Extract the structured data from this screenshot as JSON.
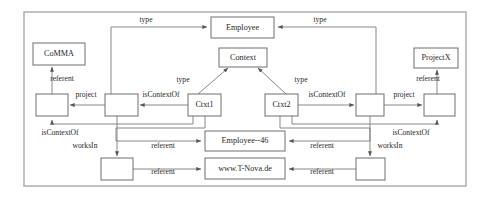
{
  "diagram": {
    "frame": {
      "x": 24,
      "y": 12,
      "width": 442,
      "height": 174,
      "stroke": "#a8a8a8"
    },
    "colors": {
      "background": "#ffffff",
      "node_stroke": "#6e6e6e",
      "edge_stroke": "#7a7a7a",
      "text": "#1f1f1f",
      "frame_stroke": "#a8a8a8"
    },
    "nodes": [
      {
        "id": "comma",
        "label": "CoMMA",
        "x": 33,
        "y": 43,
        "w": 52,
        "h": 22,
        "empty": false
      },
      {
        "id": "employee",
        "label": "Employee",
        "x": 211,
        "y": 17,
        "w": 63,
        "h": 21,
        "empty": false
      },
      {
        "id": "context",
        "label": "Context",
        "x": 219,
        "y": 48,
        "w": 48,
        "h": 19,
        "empty": false
      },
      {
        "id": "projectx",
        "label": "ProjectX",
        "x": 414,
        "y": 48,
        "w": 44,
        "h": 20,
        "empty": false
      },
      {
        "id": "ctxt1",
        "label": "Ctxt1",
        "x": 188,
        "y": 94,
        "w": 33,
        "h": 22,
        "empty": false
      },
      {
        "id": "ctxt2",
        "label": "Ctxt2",
        "x": 265,
        "y": 94,
        "w": 33,
        "h": 22,
        "empty": false
      },
      {
        "id": "employee46",
        "label": "Employee--46",
        "x": 205,
        "y": 131,
        "w": 80,
        "h": 20,
        "empty": false
      },
      {
        "id": "tnova",
        "label": "www.T-Nova.de",
        "x": 205,
        "y": 158,
        "w": 80,
        "h": 21,
        "empty": false
      },
      {
        "id": "blank-l1",
        "label": "",
        "x": 36,
        "y": 94,
        "w": 32,
        "h": 22,
        "empty": true
      },
      {
        "id": "blank-l2",
        "label": "",
        "x": 105,
        "y": 94,
        "w": 33,
        "h": 22,
        "empty": true
      },
      {
        "id": "blank-r1",
        "label": "",
        "x": 356,
        "y": 94,
        "w": 28,
        "h": 22,
        "empty": true
      },
      {
        "id": "blank-r2",
        "label": "",
        "x": 424,
        "y": 94,
        "w": 31,
        "h": 22,
        "empty": true
      },
      {
        "id": "blank-bl",
        "label": "",
        "x": 101,
        "y": 158,
        "w": 32,
        "h": 22,
        "empty": true
      },
      {
        "id": "blank-br",
        "label": "",
        "x": 356,
        "y": 158,
        "w": 29,
        "h": 22,
        "empty": true
      }
    ],
    "edge_labels": [
      {
        "id": "type-top-left",
        "text": "type",
        "x": 146,
        "y": 20
      },
      {
        "id": "type-top-right",
        "text": "type",
        "x": 320,
        "y": 20
      },
      {
        "id": "type-ctxt1",
        "text": "type",
        "x": 183,
        "y": 80
      },
      {
        "id": "type-ctxt2",
        "text": "type",
        "x": 301,
        "y": 80
      },
      {
        "id": "referent-comma",
        "text": "referent",
        "x": 62,
        "y": 79
      },
      {
        "id": "referent-projectx",
        "text": "referent",
        "x": 428,
        "y": 79
      },
      {
        "id": "project-left",
        "text": "project",
        "x": 86,
        "y": 95
      },
      {
        "id": "project-right",
        "text": "project",
        "x": 404,
        "y": 95
      },
      {
        "id": "iscontextof-left",
        "text": "isContextOf",
        "x": 161,
        "y": 95
      },
      {
        "id": "iscontextof-right",
        "text": "isContextOf",
        "x": 327,
        "y": 95
      },
      {
        "id": "iscontextof-lower-l",
        "text": "isContextOf",
        "x": 60,
        "y": 133
      },
      {
        "id": "iscontextof-lower-r",
        "text": "isContextOf",
        "x": 411,
        "y": 133
      },
      {
        "id": "worksin-left",
        "text": "worksIn",
        "x": 85,
        "y": 146
      },
      {
        "id": "worksin-right",
        "text": "worksIn",
        "x": 390,
        "y": 146
      },
      {
        "id": "referent-emp46-left",
        "text": "referent",
        "x": 163,
        "y": 146
      },
      {
        "id": "referent-emp46-right",
        "text": "referent",
        "x": 322,
        "y": 146
      },
      {
        "id": "referent-tnova-left",
        "text": "referent",
        "x": 163,
        "y": 172
      },
      {
        "id": "referent-tnova-right",
        "text": "referent",
        "x": 322,
        "y": 172
      }
    ],
    "edges": [
      {
        "id": "e-ctxt1-type-employee",
        "path": "M 111,116 L 111,27 L 207,27",
        "arrow": "end"
      },
      {
        "id": "e-ctxt2-type-employee",
        "path": "M 376,116 L 376,27 L 278,27",
        "arrow": "end"
      },
      {
        "id": "e-ctxt1-type-context",
        "path": "M 198,94 L 228,68",
        "arrow": "end"
      },
      {
        "id": "e-ctxt2-type-context",
        "path": "M 286,94 L 258,68",
        "arrow": "end"
      },
      {
        "id": "e-projectx-referent",
        "path": "M 437,94 L 437,70",
        "arrow": "end"
      },
      {
        "id": "e-comma-referent",
        "path": "M 52,94 L 52,67",
        "arrow": "end"
      },
      {
        "id": "e-blankl2-project",
        "path": "M 105,105 L 70,105",
        "arrow": "end"
      },
      {
        "id": "e-blankr1-project",
        "path": "M 384,105 L 422,105",
        "arrow": "end"
      },
      {
        "id": "e-ctxt1-iscontextof",
        "path": "M 188,105 L 140,105",
        "arrow": "end"
      },
      {
        "id": "e-ctxt2-iscontextof",
        "path": "M 298,105 L 354,105",
        "arrow": "end"
      },
      {
        "id": "e-ctxt1-lower-left",
        "path": "M 193,116 L 193,124 L 52,124 L 52,120",
        "arrow": "end"
      },
      {
        "id": "e-ctxt2-lower-right",
        "path": "M 292,116 L 292,124 L 437,124 L 437,120",
        "arrow": "end"
      },
      {
        "id": "e-ctxt1-emp46",
        "path": "M 205,116 L 205,128 L 116,128 L 116,141 L 201,141",
        "arrow": "end"
      },
      {
        "id": "e-ctxt2-emp46",
        "path": "M 280,116 L 280,128 L 370,128 L 370,141 L 289,141",
        "arrow": "end"
      },
      {
        "id": "e-blankl2-worksin",
        "path": "M 117,116 L 117,156",
        "arrow": "end"
      },
      {
        "id": "e-blankr1-worksin",
        "path": "M 370,116 L 370,156",
        "arrow": "end"
      },
      {
        "id": "e-blankbl-tnova",
        "path": "M 133,169 L 201,169",
        "arrow": "end"
      },
      {
        "id": "e-blankbr-tnova",
        "path": "M 356,169 L 289,169",
        "arrow": "end"
      }
    ]
  }
}
